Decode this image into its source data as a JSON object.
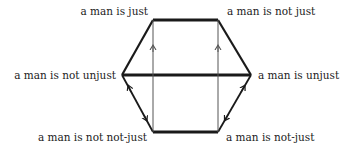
{
  "diagram": {
    "type": "hexagon-of-opposition",
    "nodes": {
      "top_left": "a man is just",
      "top_right": "a man is not just",
      "left": "a man is not unjust",
      "right": "a man is unjust",
      "bottom_left": "a man is not not-just",
      "bottom_right": "a man is not-just"
    },
    "colors": {
      "thick_line": "#1a1a1a",
      "thin_line": "#555555",
      "text": "#222222"
    }
  }
}
